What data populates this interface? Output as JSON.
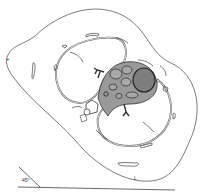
{
  "diagram": {
    "type": "anatomical cross-section",
    "labels": {
      "marker_left": "+",
      "angle": "45°",
      "marker_bottom": "L",
      "structure_a": "A",
      "structure_b": "T"
    },
    "colors": {
      "line": "#444444",
      "heart_fill": "#8a8a8a",
      "heart_dark": "#5a5a5a",
      "background": "#ffffff"
    }
  }
}
